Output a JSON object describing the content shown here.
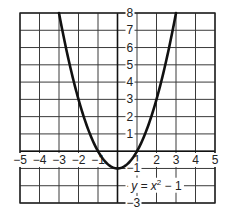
{
  "chart_data": {
    "type": "line",
    "title": "",
    "equation_label": "y = x² − 1",
    "equation_parts": {
      "lhs": "y = x",
      "exp": "2",
      "rhs": " − 1"
    },
    "xlabel": "",
    "ylabel": "",
    "xlim": [
      -5,
      5
    ],
    "ylim": [
      -3,
      8
    ],
    "grid": true,
    "legend": null,
    "x_ticks": [
      -5,
      -4,
      -3,
      -2,
      -1,
      1,
      2,
      3,
      4,
      5
    ],
    "x_tick_labels": [
      "−5",
      "−4",
      "−3",
      "−2",
      "−1",
      "1",
      "2",
      "3",
      "4",
      "5"
    ],
    "y_ticks": [
      8,
      7,
      6,
      5,
      4,
      3,
      2,
      1,
      -1,
      -2,
      -3
    ],
    "y_tick_labels": [
      "8",
      "7",
      "6",
      "5",
      "4",
      "3",
      "2",
      "1",
      "−1",
      "−2",
      "−3"
    ],
    "series": [
      {
        "name": "y = x^2 - 1",
        "x": [
          -3,
          -2.5,
          -2,
          -1.5,
          -1,
          -0.5,
          0,
          0.5,
          1,
          1.5,
          2,
          2.5,
          3
        ],
        "values": [
          8,
          5.25,
          3,
          1.25,
          0,
          -0.75,
          -1,
          -0.75,
          0,
          1.25,
          3,
          5.25,
          8
        ]
      }
    ]
  },
  "colors": {
    "curve": "#111111",
    "grid": "#3a3a3a",
    "background": "#ffffff"
  }
}
